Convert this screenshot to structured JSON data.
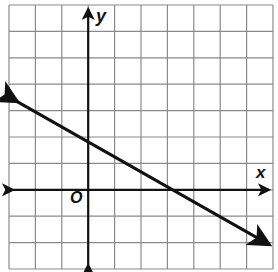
{
  "chart_data": {
    "type": "line",
    "title": "",
    "xlabel": "x",
    "ylabel": "y",
    "origin_label": "O",
    "xlim": [
      -3,
      7
    ],
    "ylim": [
      -3,
      7
    ],
    "grid": true,
    "grid_step": 1,
    "series": [
      {
        "name": "line",
        "equation": "y = -0.5x + 2",
        "slope": -0.5,
        "y_intercept": 2,
        "x_intercept": 4,
        "x": [
          -3,
          7
        ],
        "y": [
          3.5,
          -1.5
        ],
        "arrows": "both"
      }
    ]
  },
  "colors": {
    "grid": "#8a8a8a",
    "axes": "#111111",
    "line": "#111111",
    "background": "#ffffff"
  }
}
